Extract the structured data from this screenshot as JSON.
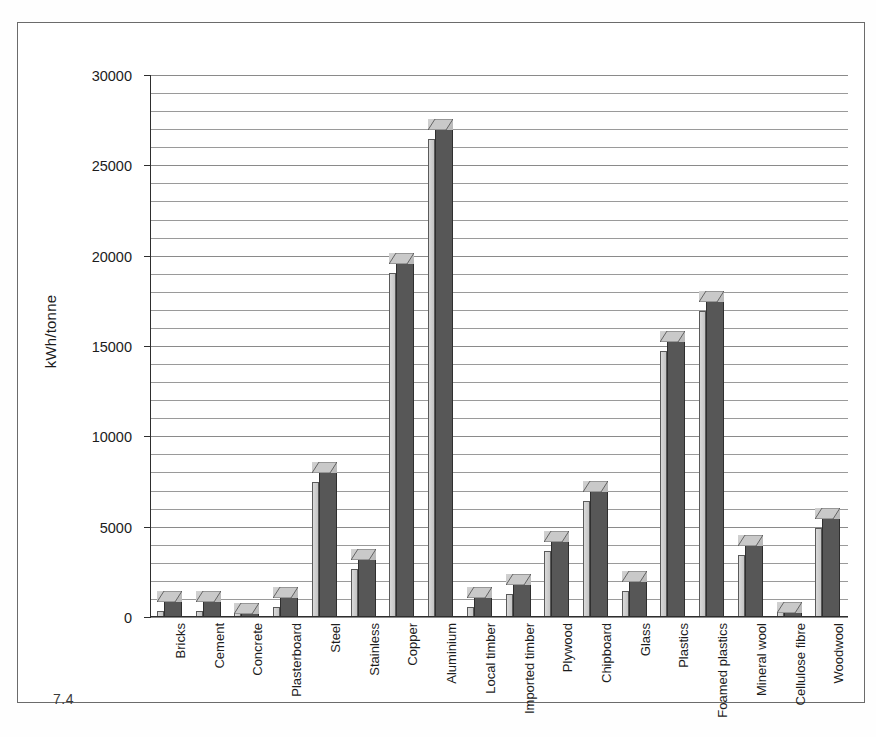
{
  "figure": {
    "caption": "7.4"
  },
  "chart_data": {
    "type": "bar",
    "title": "",
    "xlabel": "",
    "ylabel": "kWh/tonne",
    "ylim": [
      0,
      30000
    ],
    "ytick_values": [
      0,
      5000,
      10000,
      15000,
      20000,
      25000,
      30000
    ],
    "ytick_labels": [
      "0",
      "5000",
      "10000",
      "15000",
      "20000",
      "25000",
      "30000"
    ],
    "gridline_interval": 1000,
    "grid": true,
    "legend": "none",
    "style": "3d-column",
    "categories": [
      "Bricks",
      "Cement",
      "Concrete",
      "Plasterboard",
      "Steel",
      "Stainless",
      "Copper",
      "Aluminium",
      "Local timber",
      "Imported timber",
      "Plywood",
      "Chipboard",
      "Glass",
      "Plastics",
      "Foamed plastics",
      "Mineral wool",
      "Cellulose fibre",
      "Woodwool"
    ],
    "values": [
      900,
      900,
      200,
      1100,
      8000,
      3200,
      19600,
      27000,
      1100,
      1800,
      4200,
      7000,
      2000,
      15300,
      17500,
      4000,
      300,
      5500
    ]
  },
  "colors": {
    "bar_front": "#575757",
    "bar_side": "#d0d0d0",
    "bar_top": "#c8c8c8",
    "grid": "#9a9a9a",
    "axis": "#2e2e2e",
    "frame": "#6b6b6b",
    "text": "#1c1c1c",
    "background": "#ffffff"
  }
}
